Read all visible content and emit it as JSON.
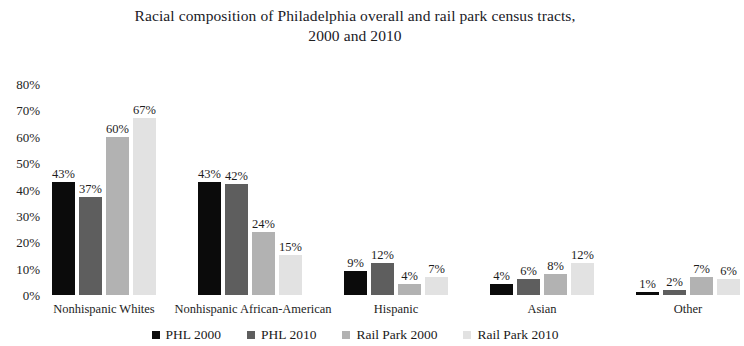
{
  "chart_data": {
    "type": "bar",
    "title": "Racial composition of Philadelphia overall and  rail park census tracts,\n2000 and 2010",
    "xlabel": "",
    "ylabel": "",
    "ylim": [
      0,
      80
    ],
    "ytick_labels": [
      "80%",
      "70%",
      "60%",
      "50%",
      "40%",
      "30%",
      "20%",
      "10%",
      "0%"
    ],
    "ytick_values": [
      80,
      70,
      60,
      50,
      40,
      30,
      20,
      10,
      0
    ],
    "grid": false,
    "legend_position": "bottom",
    "value_suffix": "%",
    "categories": [
      "Nonhispanic Whites",
      "Nonhispanic African-American",
      "Hispanic",
      "Asian",
      "Other"
    ],
    "series": [
      {
        "name": "PHL 2000",
        "color": "#0b0b0b",
        "values": [
          43,
          43,
          9,
          4,
          1
        ],
        "labels": [
          "43%",
          "43%",
          "9%",
          "4%",
          "1%"
        ]
      },
      {
        "name": "PHL 2010",
        "color": "#5e5e5e",
        "values": [
          37,
          42,
          12,
          6,
          2
        ],
        "labels": [
          "37%",
          "42%",
          "12%",
          "6%",
          "2%"
        ]
      },
      {
        "name": "Rail Park  2000",
        "color": "#b2b2b2",
        "values": [
          60,
          24,
          4,
          8,
          7
        ],
        "labels": [
          "60%",
          "24%",
          "4%",
          "8%",
          "7%"
        ]
      },
      {
        "name": "Rail Park 2010",
        "color": "#e2e2e2",
        "values": [
          67,
          15,
          7,
          12,
          6
        ],
        "labels": [
          "67%",
          "15%",
          "7%",
          "12%",
          "6%"
        ]
      }
    ]
  },
  "axis": {
    "y": {
      "t0": "80%",
      "t1": "70%",
      "t2": "60%",
      "t3": "50%",
      "t4": "40%",
      "t5": "30%",
      "t6": "20%",
      "t7": "10%",
      "t8": "0%"
    },
    "x": {
      "c0": "Nonhispanic Whites",
      "c1": "Nonhispanic African-American",
      "c2": "Hispanic",
      "c3": "Asian",
      "c4": "Other"
    }
  },
  "legend": {
    "items": [
      {
        "label": "PHL 2000",
        "color": "#0b0b0b"
      },
      {
        "label": "PHL 2010",
        "color": "#5e5e5e"
      },
      {
        "label": "Rail Park  2000",
        "color": "#b2b2b2"
      },
      {
        "label": "Rail Park 2010",
        "color": "#e2e2e2"
      }
    ]
  },
  "bars": {
    "g0": {
      "b0": "43%",
      "b1": "37%",
      "b2": "60%",
      "b3": "67%"
    },
    "g1": {
      "b0": "43%",
      "b1": "42%",
      "b2": "24%",
      "b3": "15%"
    },
    "g2": {
      "b0": "9%",
      "b1": "12%",
      "b2": "4%",
      "b3": "7%"
    },
    "g3": {
      "b0": "4%",
      "b1": "6%",
      "b2": "8%",
      "b3": "12%"
    },
    "g4": {
      "b0": "1%",
      "b1": "2%",
      "b2": "7%",
      "b3": "6%"
    }
  }
}
